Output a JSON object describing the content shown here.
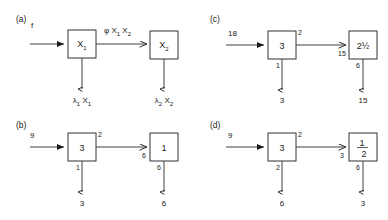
{
  "figure": {
    "title": "",
    "panels": [
      {
        "id": "a",
        "label": "(a)",
        "input_label": "f",
        "box1_label": "X",
        "box1_sub": "1",
        "box2_label": "X",
        "box2_sub": "2",
        "link_label": "φ X",
        "link_label_sub1": "1",
        "link_label_mid": " X",
        "link_label_sub2": "2",
        "box1_top_right": "",
        "box1_bottom_left": "",
        "arrow2_left": "",
        "box2_bottom_left": "",
        "out1_prefix": "λ",
        "out1_sub": "1",
        "out1_suffix": "X",
        "out1_suffix_sub": "1",
        "out2_prefix": "λ",
        "out2_sub": "2",
        "out2_suffix": "X",
        "out2_suffix_sub": "2"
      },
      {
        "id": "b",
        "label": "(b)",
        "input_label": "9",
        "box1_label": "3",
        "box2_label": "1",
        "box1_top_right": "2",
        "box1_bottom_left": "1",
        "arrow2_left": "6",
        "box2_bottom_left": "6",
        "out1": "3",
        "out2": "6"
      },
      {
        "id": "c",
        "label": "(c)",
        "input_label": "18",
        "box1_label": "3",
        "box2_label": "2½",
        "box1_top_right": "2",
        "box1_bottom_left": "1",
        "arrow2_left": "15",
        "box2_bottom_left": "6",
        "out1": "3",
        "out2": "15"
      },
      {
        "id": "d",
        "label": "(d)",
        "input_label": "9",
        "box1_label": "3",
        "box2_label_num": "1",
        "box2_label_den": "2",
        "box1_top_right": "2",
        "box1_bottom_left": "2",
        "arrow2_left": "3",
        "box2_bottom_left": "6",
        "out1": "6",
        "out2": "3"
      }
    ],
    "colors": {
      "ink": "#1a1a1a",
      "line": "#404040",
      "box_stroke": "#303030",
      "background": "#ffffff"
    }
  }
}
